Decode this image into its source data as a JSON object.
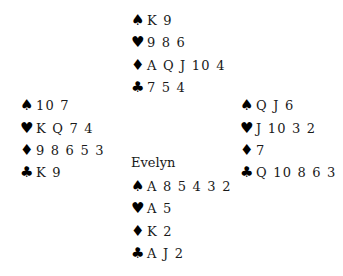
{
  "suits": {
    "spades": "♠",
    "hearts": "♥",
    "diamonds": "♦",
    "clubs": "♣"
  },
  "hands": {
    "north": {
      "name": "",
      "spades": "K 9",
      "hearts": "9 8 6",
      "diamonds": "A Q J 10 4",
      "clubs": "7 5 4"
    },
    "west": {
      "name": "",
      "spades": "10 7",
      "hearts": "K Q 7 4",
      "diamonds": "9 8 6 5 3",
      "clubs": "K 9"
    },
    "east": {
      "name": "",
      "spades": "Q J 6",
      "hearts": "J 10 3 2",
      "diamonds": "7",
      "clubs": "Q 10 8 6 3"
    },
    "south": {
      "name": "Evelyn",
      "spades": "A 8 5 4 3 2",
      "hearts": "A 5",
      "diamonds": "K 2",
      "clubs": "A J 2"
    }
  }
}
